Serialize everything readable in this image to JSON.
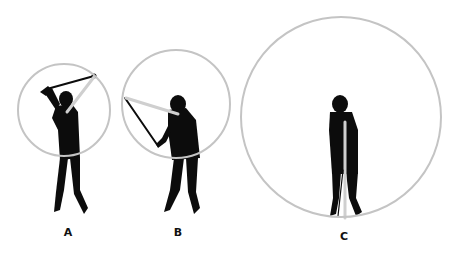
{
  "figure": {
    "panels": [
      {
        "id": "A",
        "label": "A",
        "description": "Golfer at top of backswing with small swing arc circle"
      },
      {
        "id": "B",
        "label": "B",
        "description": "Golfer in downswing with medium swing arc circle"
      },
      {
        "id": "C",
        "label": "C",
        "description": "Golfer at address with large swing arc circle"
      }
    ],
    "colors": {
      "circle": "#c4c4c4",
      "silhouette": "#0c0c0c",
      "radius_line": "#cfcfcf",
      "background": "#ffffff"
    }
  }
}
